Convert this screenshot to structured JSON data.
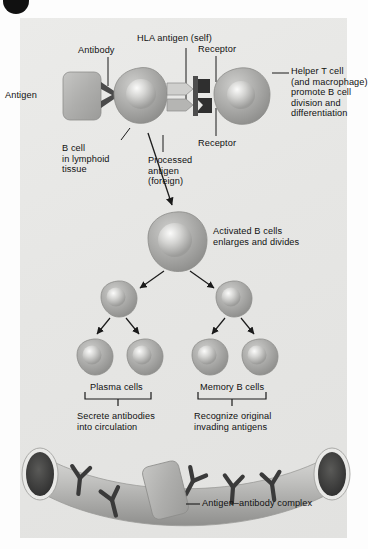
{
  "figure": {
    "panel_label": "",
    "background_color": "#e7e7e5",
    "cell_color": "#a9a9a7",
    "nucleus_color": "#c9c9c7",
    "dark_color": "#3a3a3a"
  },
  "labels": {
    "antigen": "Antigen",
    "antibody": "Antibody",
    "hla_antigen": "HLA antigen (self)",
    "receptor_top": "Receptor",
    "receptor_bottom": "Receptor",
    "helper_t_cell": "Helper T cell\n(and macrophage)\npromote B cell\ndivision and\ndifferentiation",
    "b_cell_lymphoid": "B cell\nin lymphoid\ntissue",
    "processed_antigen": "Processed\nantigen\n(foreign)",
    "activated_b_cells": "Activated B cells\nenlarges and divides",
    "plasma_cells": "Plasma cells",
    "memory_b_cells": "Memory B cells",
    "secrete_antibodies": "Secrete antibodies\ninto circulation",
    "recognize_original": "Recognize original\ninvading antigens",
    "antigen_antibody_complex": "Antigen–antibody complex"
  },
  "diagram_elements": {
    "cells": [
      {
        "name": "b-cell",
        "cx": 139,
        "cy": 95,
        "r": 27,
        "stage": "naive"
      },
      {
        "name": "helper-t-cell",
        "cx": 238,
        "cy": 95,
        "r": 27,
        "stage": "helper-t"
      },
      {
        "name": "activated-b-cell",
        "cx": 175,
        "cy": 240,
        "r": 28,
        "stage": "activated"
      },
      {
        "name": "daughter-cell-left",
        "cx": 117,
        "cy": 297,
        "r": 17,
        "stage": "daughter"
      },
      {
        "name": "daughter-cell-right",
        "cx": 232,
        "cy": 297,
        "r": 17,
        "stage": "daughter"
      },
      {
        "name": "plasma-cell-1",
        "cx": 93,
        "cy": 355,
        "r": 17,
        "stage": "plasma"
      },
      {
        "name": "plasma-cell-2",
        "cx": 143,
        "cy": 355,
        "r": 17,
        "stage": "plasma"
      },
      {
        "name": "memory-cell-1",
        "cx": 208,
        "cy": 355,
        "r": 17,
        "stage": "memory"
      },
      {
        "name": "memory-cell-2",
        "cx": 258,
        "cy": 355,
        "r": 17,
        "stage": "memory"
      }
    ],
    "antigen_box": {
      "x": 63,
      "y": 72,
      "width": 38,
      "height": 48
    },
    "vessel": {
      "left_x": 28,
      "right_x": 340,
      "top_y": 452,
      "bottom_y": 540
    },
    "antibodies_in_vessel": 5
  }
}
